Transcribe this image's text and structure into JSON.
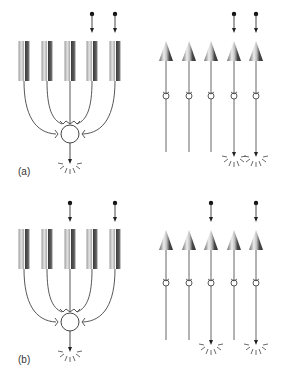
{
  "figure": {
    "panels": [
      {
        "id": "a",
        "label": "(a)",
        "convergent": {
          "description": "Five rods converging onto a single bipolar/ganglion cell",
          "rod_count": 5,
          "stimulated_rods": [
            4,
            5
          ],
          "output_fires": true
        },
        "divergent": {
          "description": "Five cones each with private line to output",
          "cone_count": 5,
          "stimulated_cones": [
            4,
            5
          ],
          "firing_outputs": [
            4,
            5
          ]
        }
      },
      {
        "id": "b",
        "label": "(b)",
        "convergent": {
          "description": "Five rods converging onto a single bipolar/ganglion cell",
          "rod_count": 5,
          "stimulated_rods": [
            3,
            5
          ],
          "output_fires": true
        },
        "divergent": {
          "description": "Five cones each with private line to output",
          "cone_count": 5,
          "stimulated_cones": [
            3,
            5
          ],
          "firing_outputs": [
            3,
            5
          ]
        }
      }
    ],
    "colors": {
      "line": "#555555",
      "dot": "#111111",
      "rod_light": "#d8d8d8",
      "rod_dark": "#4a4a4a",
      "cone_light": "#e6e6e6",
      "cone_dark": "#3c3c3c"
    }
  }
}
